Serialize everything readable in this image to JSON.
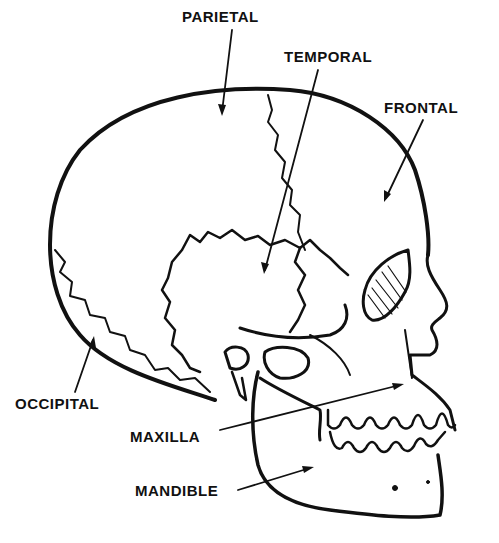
{
  "diagram": {
    "colors": {
      "ink": "#111111",
      "background": "#ffffff"
    },
    "labels": [
      {
        "id": "parietal",
        "text": "PARIETAL",
        "x": 182,
        "y": 8
      },
      {
        "id": "temporal",
        "text": "TEMPORAL",
        "x": 284,
        "y": 48
      },
      {
        "id": "frontal",
        "text": "FRONTAL",
        "x": 384,
        "y": 99
      },
      {
        "id": "occipital",
        "text": "OCCIPITAL",
        "x": 15,
        "y": 395
      },
      {
        "id": "maxilla",
        "text": "MAXILLA",
        "x": 130,
        "y": 428
      },
      {
        "id": "mandible",
        "text": "MANDIBLE",
        "x": 135,
        "y": 482
      }
    ]
  }
}
